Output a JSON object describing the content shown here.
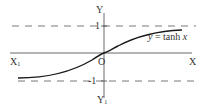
{
  "diagram": {
    "function_label": "y = tanh x",
    "function_label_parts": {
      "y": "y",
      "eq": " = tanh ",
      "x": "x"
    },
    "axes": {
      "x_positive": "X",
      "x_negative": "X",
      "x_negative_sub": "1",
      "y_positive": "Y",
      "y_negative": "Y",
      "y_negative_sub": "1",
      "origin": "O"
    },
    "asymptotes": {
      "upper": "1",
      "lower": "-1"
    },
    "colors": {
      "curve": "#1a1a1a",
      "axes": "#444444",
      "dashes": "#555555",
      "text": "#333333"
    }
  }
}
